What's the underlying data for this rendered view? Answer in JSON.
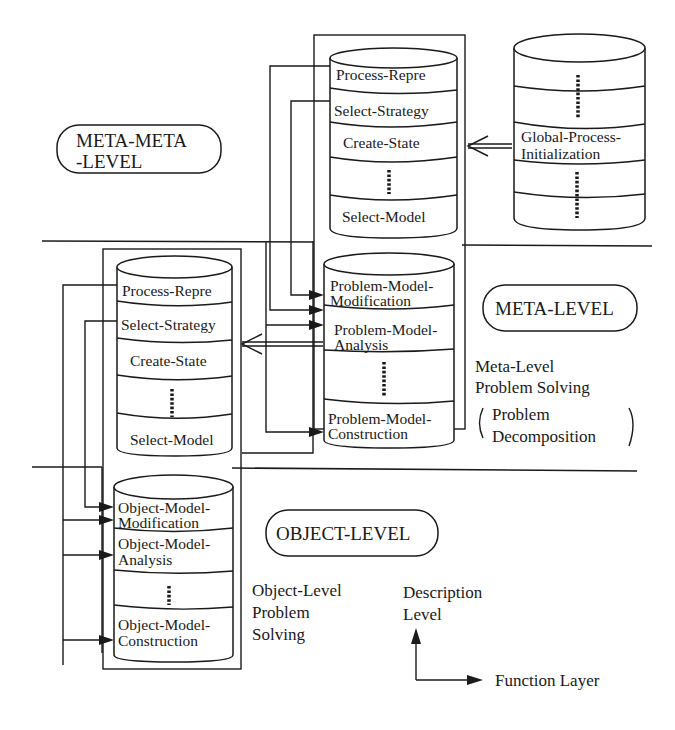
{
  "diagram": {
    "levels": {
      "meta_meta": {
        "label_line1": "META-META",
        "label_line2": "-LEVEL"
      },
      "meta": {
        "label": "META-LEVEL"
      },
      "object": {
        "label": "OBJECT-LEVEL"
      }
    },
    "meta_meta_process_cylinder": {
      "cells": [
        "Process-Repre",
        "Select-Strategy",
        "Create-State",
        "",
        "Select-Model"
      ]
    },
    "global_cylinder": {
      "cell_line1": "Global-Process-",
      "cell_line2": "Initialization"
    },
    "meta_process_cylinder": {
      "cells": [
        "Process-Repre",
        "Select-Strategy",
        "Create-State",
        "",
        "Select-Model"
      ]
    },
    "problem_model_cylinder": {
      "cells": [
        {
          "line1": "Problem-Model-",
          "line2": "Modification"
        },
        {
          "line1": "Problem-Model-",
          "line2": "Analysis"
        },
        {
          "line1": "",
          "line2": ""
        },
        {
          "line1": "Problem-Model-",
          "line2": "Construction"
        }
      ]
    },
    "object_model_cylinder": {
      "cells": [
        {
          "line1": "Object-Model-",
          "line2": "Modification"
        },
        {
          "line1": "Object-Model-",
          "line2": "Analysis"
        },
        {
          "line1": "",
          "line2": ""
        },
        {
          "line1": "Object-Model-",
          "line2": "Construction"
        }
      ]
    },
    "captions": {
      "meta_solving_line1": "Meta-Level",
      "meta_solving_line2": "Problem Solving",
      "meta_paren_line1": "Problem",
      "meta_paren_line2": "Decomposition",
      "object_solving_line1": "Object-Level",
      "object_solving_line2": "Problem",
      "object_solving_line3": "Solving"
    },
    "axes": {
      "vertical_line1": "Description",
      "vertical_line2": "Level",
      "horizontal": "Function Layer"
    }
  }
}
